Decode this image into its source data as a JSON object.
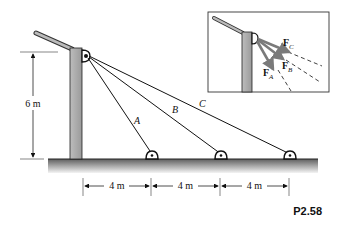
{
  "figure": {
    "label": "P2.58",
    "height_dimension": "6 m",
    "spacing_dimensions": [
      "4 m",
      "4 m",
      "4 m"
    ],
    "cables": [
      {
        "name": "A"
      },
      {
        "name": "B"
      },
      {
        "name": "C"
      }
    ],
    "inset": {
      "forces": [
        {
          "symbol": "F",
          "subscript": "C"
        },
        {
          "symbol": "F",
          "subscript": "B"
        },
        {
          "symbol": "F",
          "subscript": "A"
        }
      ]
    },
    "colors": {
      "pole": "#a8a8a8",
      "ground_top": "#6e6e6e",
      "ground_bottom": "#f2f2f2",
      "arrow": "#8c8c8c",
      "line": "#111111"
    }
  }
}
